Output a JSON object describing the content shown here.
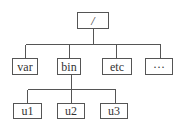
{
  "diagram": {
    "type": "tree",
    "nodes": [
      {
        "id": "root",
        "label": "/",
        "x": 77,
        "y": 12,
        "w": 32,
        "h": 17
      },
      {
        "id": "var",
        "label": "var",
        "x": 12,
        "y": 58,
        "w": 26,
        "h": 17
      },
      {
        "id": "bin",
        "label": "bin",
        "x": 57,
        "y": 58,
        "w": 24,
        "h": 17
      },
      {
        "id": "etc",
        "label": "etc",
        "x": 102,
        "y": 58,
        "w": 30,
        "h": 17
      },
      {
        "id": "more",
        "label": "···",
        "x": 145,
        "y": 58,
        "w": 28,
        "h": 17
      },
      {
        "id": "u1",
        "label": "u1",
        "x": 13,
        "y": 103,
        "w": 29,
        "h": 16
      },
      {
        "id": "u2",
        "label": "u2",
        "x": 57,
        "y": 103,
        "w": 28,
        "h": 16
      },
      {
        "id": "u3",
        "label": "u3",
        "x": 100,
        "y": 103,
        "w": 28,
        "h": 16
      }
    ],
    "edges": [
      {
        "from": "root",
        "to": "var"
      },
      {
        "from": "root",
        "to": "bin"
      },
      {
        "from": "root",
        "to": "etc"
      },
      {
        "from": "root",
        "to": "more"
      },
      {
        "from": "bin",
        "to": "u1"
      },
      {
        "from": "bin",
        "to": "u2"
      },
      {
        "from": "bin",
        "to": "u3"
      }
    ],
    "colors": {
      "line": "#555555",
      "text": "#333333",
      "background": "#ffffff"
    }
  }
}
